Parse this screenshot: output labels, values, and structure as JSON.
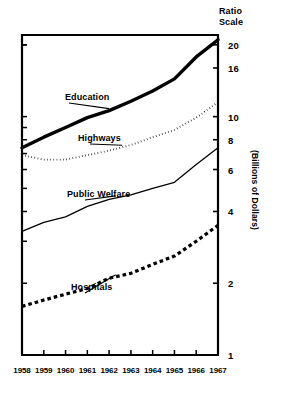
{
  "chart_data": {
    "type": "line",
    "title": "",
    "scale_note": "Ratio\nScale",
    "ylabel": "(Billions of Dollars)",
    "xlabel": "",
    "log_scale": true,
    "ylim": [
      1,
      22
    ],
    "yticks": [
      1,
      2,
      4,
      6,
      8,
      10,
      16,
      20
    ],
    "ytick_labels": [
      "1",
      "2",
      "4",
      "6",
      "8",
      "10",
      "16",
      "20"
    ],
    "x": [
      1958,
      1959,
      1960,
      1961,
      1962,
      1963,
      1964,
      1965,
      1966,
      1967
    ],
    "xtick_labels": [
      "1958",
      "1959",
      "1960",
      "1961",
      "1962",
      "1963",
      "1964",
      "1965",
      "1966",
      "1967"
    ],
    "grid": false,
    "legend": "inline-annotations",
    "series": [
      {
        "name": "Education",
        "style": "thick-solid",
        "values": [
          7.4,
          8.2,
          9.0,
          9.9,
          10.6,
          11.6,
          12.8,
          14.4,
          17.8,
          21.0
        ]
      },
      {
        "name": "Highways",
        "style": "fine-dotted",
        "values": [
          6.9,
          6.6,
          6.6,
          6.9,
          7.2,
          7.6,
          8.2,
          8.8,
          9.9,
          11.5
        ]
      },
      {
        "name": "Public Welfare",
        "style": "thin-solid",
        "values": [
          3.3,
          3.6,
          3.8,
          4.2,
          4.5,
          4.7,
          5.0,
          5.3,
          6.3,
          7.4
        ]
      },
      {
        "name": "Hospitals",
        "style": "thick-dashed",
        "values": [
          1.6,
          1.7,
          1.8,
          1.9,
          2.1,
          2.2,
          2.4,
          2.6,
          3.0,
          3.5
        ]
      }
    ]
  },
  "annotations": [
    {
      "name": "Education",
      "label": "Education"
    },
    {
      "name": "Highways",
      "label": "Highways"
    },
    {
      "name": "Public Welfare",
      "label": "Public Welfare"
    },
    {
      "name": "Hospitals",
      "label": "Hospitals"
    }
  ]
}
